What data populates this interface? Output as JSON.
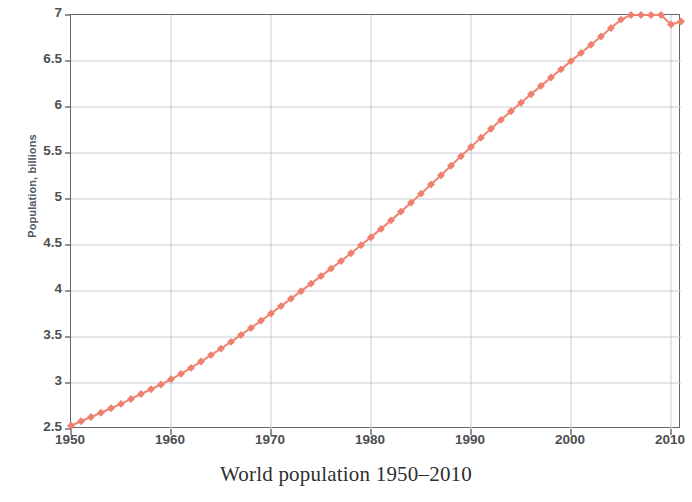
{
  "caption": "World population 1950–2010",
  "axes": {
    "ylabel": "Population, billions",
    "ytick_labels": [
      "7",
      "6.5",
      "6",
      "5.5",
      "5",
      "4.5",
      "4",
      "3.5",
      "3",
      "2.5"
    ],
    "xtick_labels": [
      "1950",
      "1960",
      "1970",
      "1980",
      "1990",
      "2000",
      "2010"
    ]
  },
  "colors": {
    "series": "#F08573",
    "marker": "#EE8070",
    "axis": "#63666B",
    "grid": "#C9CCD1",
    "text": "#4B4E52",
    "caption": "#2D2F31",
    "background": "#FFFFFF"
  },
  "chart_data": {
    "type": "line",
    "title": "World population 1950–2010",
    "xlabel": "",
    "ylabel": "Population, billions",
    "xlim": [
      1950,
      2011
    ],
    "ylim": [
      2.5,
      7.0
    ],
    "xticks": [
      1950,
      1960,
      1970,
      1980,
      1990,
      2000,
      2010
    ],
    "yticks": [
      2.5,
      3.0,
      3.5,
      4.0,
      4.5,
      5.0,
      5.5,
      6.0,
      6.5,
      7.0
    ],
    "grid": true,
    "legend": "none",
    "marker": "diamond",
    "series": [
      {
        "name": "World population",
        "x": [
          1950,
          1951,
          1952,
          1953,
          1954,
          1955,
          1956,
          1957,
          1958,
          1959,
          1960,
          1961,
          1962,
          1963,
          1964,
          1965,
          1966,
          1967,
          1968,
          1969,
          1970,
          1971,
          1972,
          1973,
          1974,
          1975,
          1976,
          1977,
          1978,
          1979,
          1980,
          1981,
          1982,
          1983,
          1984,
          1985,
          1986,
          1987,
          1988,
          1989,
          1990,
          1991,
          1992,
          1993,
          1994,
          1995,
          1996,
          1997,
          1998,
          1999,
          2000,
          2001,
          2002,
          2003,
          2004,
          2005,
          2006,
          2007,
          2008,
          2009,
          2010,
          2011
        ],
        "values": [
          2.536,
          2.584,
          2.63,
          2.677,
          2.725,
          2.773,
          2.827,
          2.88,
          2.932,
          2.984,
          3.04,
          3.099,
          3.164,
          3.233,
          3.303,
          3.374,
          3.447,
          3.522,
          3.598,
          3.676,
          3.756,
          3.836,
          3.917,
          3.998,
          4.08,
          4.162,
          4.243,
          4.325,
          4.41,
          4.497,
          4.585,
          4.675,
          4.768,
          4.863,
          4.96,
          5.058,
          5.157,
          5.259,
          5.362,
          5.464,
          5.566,
          5.666,
          5.764,
          5.86,
          5.954,
          6.047,
          6.139,
          6.23,
          6.32,
          6.409,
          6.499,
          6.588,
          6.677,
          6.767,
          6.858,
          6.95,
          7.043,
          7.136,
          7.229,
          7.322,
          6.896,
          6.93
        ]
      }
    ]
  }
}
